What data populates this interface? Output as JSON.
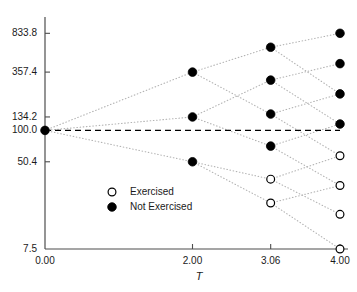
{
  "chart_data": {
    "type": "scatter",
    "title": "",
    "subtitle": "",
    "xlabel": "T",
    "ylabel": "",
    "yscale": "log",
    "grid": false,
    "xlim": [
      0.0,
      4.0
    ],
    "ylim": [
      7.5,
      1000.0
    ],
    "x_ticks": [
      {
        "value": 0.0,
        "label": "0.00"
      },
      {
        "value": 2.0,
        "label": "2.00"
      },
      {
        "value": 3.06,
        "label": "3.06"
      },
      {
        "value": 4.0,
        "label": "4.00"
      }
    ],
    "y_ticks": [
      {
        "value": 833.8,
        "label": "833.8"
      },
      {
        "value": 357.4,
        "label": "357.4"
      },
      {
        "value": 134.2,
        "label": "134.2"
      },
      {
        "value": 100.0,
        "label": "100.0"
      },
      {
        "value": 50.4,
        "label": "50.4"
      },
      {
        "value": 7.5,
        "label": "7.5"
      }
    ],
    "reference_line": {
      "orientation": "horizontal",
      "value": 100.0,
      "style": "dashed",
      "color": "#000000"
    },
    "legend": {
      "position": "inside-lower-left",
      "entries": [
        {
          "label": "Exercised",
          "marker": "open-circle",
          "fill": "#ffffff",
          "stroke": "#000000"
        },
        {
          "label": "Not Exercised",
          "marker": "filled-circle",
          "fill": "#000000",
          "stroke": "#000000"
        }
      ]
    },
    "series": [
      {
        "name": "Lattice nodes",
        "points": [
          {
            "id": "n0_0",
            "x": 0.0,
            "y": 100.0,
            "state": "not-exercised"
          },
          {
            "id": "n1_0",
            "x": 2.0,
            "y": 357.4,
            "state": "not-exercised"
          },
          {
            "id": "n1_1",
            "x": 2.0,
            "y": 134.2,
            "state": "not-exercised"
          },
          {
            "id": "n1_2",
            "x": 2.0,
            "y": 50.4,
            "state": "not-exercised"
          },
          {
            "id": "n2_0",
            "x": 3.06,
            "y": 615.0,
            "state": "not-exercised"
          },
          {
            "id": "n2_1",
            "x": 3.06,
            "y": 300.0,
            "state": "not-exercised"
          },
          {
            "id": "n2_2",
            "x": 3.06,
            "y": 143.0,
            "state": "not-exercised"
          },
          {
            "id": "n2_3",
            "x": 3.06,
            "y": 71.0,
            "state": "not-exercised"
          },
          {
            "id": "n2_4",
            "x": 3.06,
            "y": 34.5,
            "state": "exercised"
          },
          {
            "id": "n2_5",
            "x": 3.06,
            "y": 20.5,
            "state": "exercised"
          },
          {
            "id": "n3_0",
            "x": 4.0,
            "y": 833.8,
            "state": "not-exercised"
          },
          {
            "id": "n3_1",
            "x": 4.0,
            "y": 430.0,
            "state": "not-exercised"
          },
          {
            "id": "n3_2",
            "x": 4.0,
            "y": 222.0,
            "state": "not-exercised"
          },
          {
            "id": "n3_3",
            "x": 4.0,
            "y": 115.0,
            "state": "not-exercised"
          },
          {
            "id": "n3_4",
            "x": 4.0,
            "y": 57.5,
            "state": "exercised"
          },
          {
            "id": "n3_5",
            "x": 4.0,
            "y": 30.0,
            "state": "exercised"
          },
          {
            "id": "n3_6",
            "x": 4.0,
            "y": 16.0,
            "state": "exercised"
          },
          {
            "id": "n3_7",
            "x": 4.0,
            "y": 7.5,
            "state": "exercised"
          }
        ],
        "edges": [
          [
            "n0_0",
            "n1_0"
          ],
          [
            "n0_0",
            "n1_1"
          ],
          [
            "n0_0",
            "n1_2"
          ],
          [
            "n1_0",
            "n2_0"
          ],
          [
            "n1_0",
            "n2_2"
          ],
          [
            "n1_1",
            "n2_1"
          ],
          [
            "n1_1",
            "n2_3"
          ],
          [
            "n1_2",
            "n2_4"
          ],
          [
            "n1_2",
            "n2_5"
          ],
          [
            "n2_0",
            "n3_0"
          ],
          [
            "n2_0",
            "n3_2"
          ],
          [
            "n2_1",
            "n3_1"
          ],
          [
            "n2_1",
            "n3_3"
          ],
          [
            "n2_2",
            "n3_2"
          ],
          [
            "n2_2",
            "n3_4"
          ],
          [
            "n2_3",
            "n3_3"
          ],
          [
            "n2_3",
            "n3_5"
          ],
          [
            "n2_4",
            "n3_4"
          ],
          [
            "n2_4",
            "n3_6"
          ],
          [
            "n2_5",
            "n3_5"
          ],
          [
            "n2_5",
            "n3_7"
          ]
        ]
      }
    ]
  },
  "colors": {
    "axis": "#4d4d4d",
    "text": "#1a1a1a",
    "node_fill": "#000000",
    "node_open_fill": "#ffffff",
    "edge": "#b3b3b3",
    "reference_line": "#000000"
  }
}
